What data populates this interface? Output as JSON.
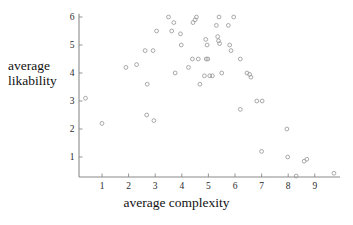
{
  "chart_data": {
    "type": "scatter",
    "title": "",
    "xlabel": "average complexity",
    "ylabel": "average likability",
    "ylabel_line1": "average",
    "ylabel_line2": "likability",
    "xlim": [
      0.2,
      10.0
    ],
    "ylim": [
      0.25,
      6.2
    ],
    "xticks": [
      1,
      2,
      3,
      4,
      5,
      6,
      7,
      8,
      9
    ],
    "yticks": [
      1,
      2,
      3,
      4,
      5,
      6
    ],
    "xtick_labels": [
      "1",
      "2",
      "3",
      "4",
      "5",
      "6",
      "7",
      "8",
      "9"
    ],
    "ytick_labels": [
      "1",
      "2",
      "3",
      "4",
      "5",
      "6"
    ],
    "grid": false,
    "legend": null,
    "marker": "open-circle",
    "marker_color": "#9a9a9a",
    "axis_color": "#8a8a8a",
    "points": [
      {
        "x": 0.38,
        "y": 3.1
      },
      {
        "x": 1.0,
        "y": 2.2
      },
      {
        "x": 1.9,
        "y": 4.2
      },
      {
        "x": 2.3,
        "y": 4.3
      },
      {
        "x": 2.62,
        "y": 4.8
      },
      {
        "x": 2.7,
        "y": 3.6
      },
      {
        "x": 2.68,
        "y": 2.5
      },
      {
        "x": 2.92,
        "y": 4.8
      },
      {
        "x": 2.95,
        "y": 2.3
      },
      {
        "x": 3.05,
        "y": 5.5
      },
      {
        "x": 3.5,
        "y": 6.0
      },
      {
        "x": 3.62,
        "y": 5.5
      },
      {
        "x": 3.7,
        "y": 5.8
      },
      {
        "x": 3.75,
        "y": 4.0
      },
      {
        "x": 3.95,
        "y": 5.4
      },
      {
        "x": 3.98,
        "y": 5.0
      },
      {
        "x": 4.25,
        "y": 4.2
      },
      {
        "x": 4.42,
        "y": 5.8
      },
      {
        "x": 4.5,
        "y": 5.9
      },
      {
        "x": 4.55,
        "y": 6.0
      },
      {
        "x": 4.4,
        "y": 4.5
      },
      {
        "x": 4.62,
        "y": 4.5
      },
      {
        "x": 4.68,
        "y": 3.6
      },
      {
        "x": 4.9,
        "y": 5.2
      },
      {
        "x": 4.95,
        "y": 5.0
      },
      {
        "x": 4.92,
        "y": 4.5
      },
      {
        "x": 4.98,
        "y": 4.5
      },
      {
        "x": 4.85,
        "y": 3.9
      },
      {
        "x": 5.05,
        "y": 3.9
      },
      {
        "x": 5.15,
        "y": 3.9
      },
      {
        "x": 5.3,
        "y": 5.7
      },
      {
        "x": 5.35,
        "y": 5.3
      },
      {
        "x": 5.4,
        "y": 6.0
      },
      {
        "x": 5.38,
        "y": 5.15
      },
      {
        "x": 5.42,
        "y": 5.05
      },
      {
        "x": 5.5,
        "y": 4.0
      },
      {
        "x": 5.75,
        "y": 5.7
      },
      {
        "x": 5.8,
        "y": 5.0
      },
      {
        "x": 5.85,
        "y": 4.8
      },
      {
        "x": 5.95,
        "y": 6.0
      },
      {
        "x": 6.2,
        "y": 4.5
      },
      {
        "x": 6.2,
        "y": 2.7
      },
      {
        "x": 6.45,
        "y": 4.0
      },
      {
        "x": 6.55,
        "y": 3.95
      },
      {
        "x": 6.6,
        "y": 3.85
      },
      {
        "x": 6.82,
        "y": 3.0
      },
      {
        "x": 7.02,
        "y": 3.0
      },
      {
        "x": 7.0,
        "y": 1.2
      },
      {
        "x": 7.95,
        "y": 2.0
      },
      {
        "x": 7.98,
        "y": 1.0
      },
      {
        "x": 8.3,
        "y": 0.32
      },
      {
        "x": 8.6,
        "y": 0.85
      },
      {
        "x": 8.7,
        "y": 0.92
      },
      {
        "x": 9.72,
        "y": 0.42
      }
    ]
  }
}
